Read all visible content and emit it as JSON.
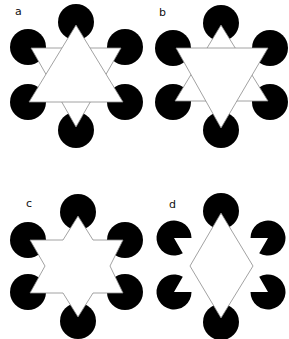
{
  "figure": {
    "panels": [
      {
        "label": "a",
        "variant": "upward triangle over downward triangle"
      },
      {
        "label": "b",
        "variant": "downward triangle over upward triangle"
      },
      {
        "label": "c",
        "variant": "hexagram-like star outline"
      },
      {
        "label": "d",
        "variant": "diamond with pac-man inducers"
      }
    ]
  },
  "colors": {
    "inducer": "#000000",
    "figure_fill": "#ffffff",
    "outline": "#8a8a8a",
    "background": "#ffffff"
  }
}
